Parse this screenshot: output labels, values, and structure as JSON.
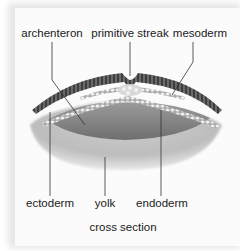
{
  "diagram": {
    "type": "biology-cross-section",
    "caption": "cross section",
    "labels_top": [
      {
        "text": "archenteron",
        "x": 52
      },
      {
        "text": "primitive streak",
        "x": 130
      },
      {
        "text": "mesoderm",
        "x": 200
      }
    ],
    "labels_bottom": [
      {
        "text": "ectoderm",
        "x": 50
      },
      {
        "text": "yolk",
        "x": 105
      },
      {
        "text": "endoderm",
        "x": 162
      }
    ],
    "colors": {
      "background": "#fbfbfb",
      "shadow": "#e6e6e6",
      "ectoderm": "#555555",
      "yolk": "#c8c8c8",
      "archenteron": "#8a8a8a",
      "cell_layer": "#dcdcdc",
      "leader_line": "#333333",
      "text": "#1a1a1a"
    }
  }
}
